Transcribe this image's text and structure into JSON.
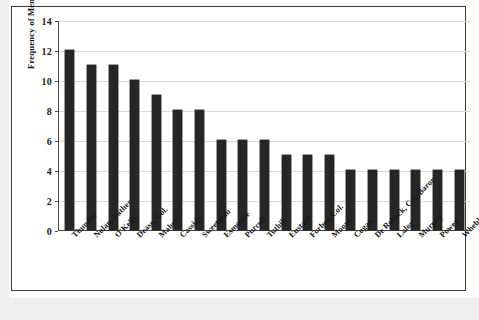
{
  "chart_data": {
    "type": "bar",
    "title": "",
    "xlabel": "",
    "ylabel": "Frequency of Mentions",
    "ylim": [
      0,
      14
    ],
    "yticks": [
      0,
      2,
      4,
      6,
      8,
      10,
      12,
      14
    ],
    "grid": true,
    "legend": "none",
    "bar_color": "#262626",
    "categories": [
      "Thunder",
      "Nolan, Father",
      "O'Kelly",
      "Dease, Col.",
      "Maher",
      "Cassidy",
      "Sweetman",
      "Esmonde",
      "Purcell",
      "Tuthill",
      "Eustace",
      "Forbes, Col.",
      "Moore",
      "Cogan",
      "De Robeck, Col. Baron",
      "Lalor",
      "Murphy",
      "Power",
      "Wheble"
    ],
    "values": [
      12,
      11,
      11,
      10,
      9,
      8,
      8,
      6,
      6,
      6,
      5,
      5,
      5,
      4,
      4,
      4,
      4,
      4,
      4
    ]
  },
  "figure": {
    "artifact_1": "",
    "artifact_2": ""
  }
}
